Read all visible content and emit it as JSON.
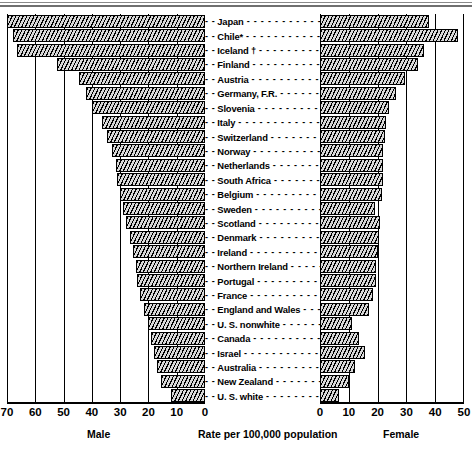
{
  "chart_data": {
    "type": "bar",
    "subtype": "population-pyramid",
    "title": "",
    "xlabel": "Rate per 100,000 population",
    "ylabel": "",
    "orientation": "horizontal",
    "grid": true,
    "legend_position": "none",
    "panels": [
      {
        "name": "Male",
        "axis_label": "Male",
        "direction": "left",
        "ticks": [
          70,
          60,
          50,
          40,
          30,
          20,
          10,
          0
        ],
        "xlim": [
          70,
          0
        ]
      },
      {
        "name": "Female",
        "axis_label": "Female",
        "direction": "right",
        "ticks": [
          0,
          10,
          20,
          30,
          40,
          50
        ],
        "xlim": [
          0,
          50
        ]
      }
    ],
    "axis_caption": "Rate per 100,000 population",
    "categories": [
      "Japan",
      "Chile*",
      "Iceland †",
      "Finland",
      "Austria",
      "Germany, F.R.",
      "Slovenia",
      "Italy",
      "Switzerland",
      "Norway",
      "Netherlands",
      "South Africa",
      "Belgium",
      "Sweden",
      "Denmark",
      "Scotland",
      "Ireland",
      "Northern Ireland",
      "Portugal",
      "France",
      "England and Wales",
      "U. S. nonwhite",
      "Canada",
      "Israel",
      "Australia",
      "New Zealand",
      "U. S. white"
    ],
    "rows": [
      {
        "label": "Japan",
        "male": 70.0,
        "female": 38.0
      },
      {
        "label": "Chile*",
        "male": 68.0,
        "female": 48.0
      },
      {
        "label": "Iceland †",
        "male": 66.5,
        "female": 36.0
      },
      {
        "label": "Finland",
        "male": 52.5,
        "female": 34.0
      },
      {
        "label": "Austria",
        "male": 44.5,
        "female": 29.5
      },
      {
        "label": "Germany, F.R.",
        "male": 42.0,
        "female": 26.5
      },
      {
        "label": "Slovenia",
        "male": 40.0,
        "female": 24.0
      },
      {
        "label": "Italy",
        "male": 36.5,
        "female": 23.0
      },
      {
        "label": "Switzerland",
        "male": 34.5,
        "female": 22.5
      },
      {
        "label": "Norway",
        "male": 33.0,
        "female": 22.0
      },
      {
        "label": "Netherlands",
        "male": 31.5,
        "female": 22.0
      },
      {
        "label": "South Africa",
        "male": 31.0,
        "female": 22.0
      },
      {
        "label": "Belgium",
        "male": 30.0,
        "female": 21.5
      },
      {
        "label": "Sweden",
        "male": 29.0,
        "female": 19.0
      },
      {
        "label": "Scotland",
        "male": 28.0,
        "female": 21.0
      },
      {
        "label": "Denmark",
        "male": 26.5,
        "female": 20.5
      },
      {
        "label": "Ireland",
        "male": 25.5,
        "female": 20.0
      },
      {
        "label": "Northern Ireland",
        "male": 24.5,
        "female": 19.5
      },
      {
        "label": "Portugal",
        "male": 24.0,
        "female": 19.5
      },
      {
        "label": "France",
        "male": 23.0,
        "female": 18.5
      },
      {
        "label": "England and Wales",
        "male": 21.5,
        "female": 17.0
      },
      {
        "label": "U. S. nonwhite",
        "male": 20.0,
        "female": 11.0
      },
      {
        "label": "Canada",
        "male": 19.0,
        "female": 13.5
      },
      {
        "label": "Israel",
        "male": 18.0,
        "female": 15.5
      },
      {
        "label": "Australia",
        "male": 17.0,
        "female": 12.0
      },
      {
        "label": "New Zealand",
        "male": 15.5,
        "female": 10.0
      },
      {
        "label": "U. S. white",
        "male": 12.0,
        "female": 6.5
      }
    ]
  },
  "left_ticks": [
    "70",
    "60",
    "50",
    "40",
    "30",
    "20",
    "10",
    "0"
  ],
  "right_ticks": [
    "0",
    "10",
    "20",
    "30",
    "40",
    "50"
  ],
  "captions": {
    "male": "Male",
    "female": "Female",
    "rate": "Rate per 100,000 population"
  },
  "dash_leader": "- - - - - - - - - - - - - - - - - - - - -",
  "dash_prefix": "- -"
}
